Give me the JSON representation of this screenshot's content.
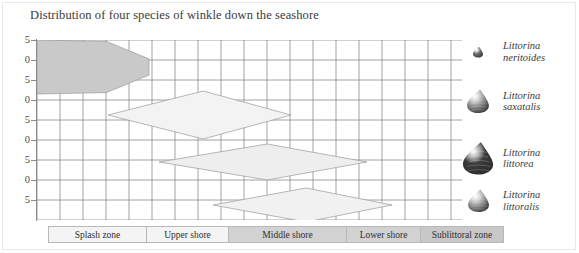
{
  "title": "Distribution of four species of winkle down the seashore",
  "chart_data": {
    "type": "area",
    "title": "Distribution of four species of winkle down the seashore",
    "xlabel": "",
    "ylabel": "",
    "grid": true,
    "legend_position": "right",
    "y_ticks": [
      "5",
      "0",
      "5",
      "0",
      "5",
      "0",
      "5",
      "0",
      "5"
    ],
    "zones": [
      {
        "label": "Splash zone",
        "width_px": 98,
        "fill": "#f4f4f4"
      },
      {
        "label": "Upper shore",
        "width_px": 82,
        "fill": "#f4f4f4"
      },
      {
        "label": "Middle shore",
        "width_px": 118,
        "fill": "#d2d2d2"
      },
      {
        "label": "Lower shore",
        "width_px": 74,
        "fill": "#d2d2d2"
      },
      {
        "label": "Sublittoral zone",
        "width_px": 82,
        "fill": "#c8c8c8"
      }
    ],
    "series": [
      {
        "name": "Littorina neritoides",
        "fill": "#c9c9c9",
        "start_x": 0,
        "end_x": 112,
        "center_y": 27,
        "peak_half_height": 27,
        "shape": "block-taper"
      },
      {
        "name": "Littorina saxatalis",
        "fill": "#f3f3f3",
        "start_x": 71,
        "end_x": 254,
        "center_y": 75,
        "peak_half_height": 24,
        "shape": "kite"
      },
      {
        "name": "Littorina littorea",
        "fill": "#eeeeee",
        "start_x": 122,
        "end_x": 330,
        "center_y": 122,
        "peak_half_height": 18,
        "shape": "kite"
      },
      {
        "name": "Littorina littoralis",
        "fill": "#f1f1f1",
        "start_x": 176,
        "end_x": 355,
        "center_y": 165,
        "peak_half_height": 17,
        "shape": "kite"
      }
    ]
  },
  "legend": {
    "items": [
      {
        "name_line1": "Littorina",
        "name_line2": "neritoides",
        "shell": "shell-small-dark",
        "size": 12,
        "tone": "#6a6a6a"
      },
      {
        "name_line1": "Littorina",
        "name_line2": "saxatalis",
        "shell": "shell-medium-grey",
        "size": 26,
        "tone": "#9d9d9d"
      },
      {
        "name_line1": "Littorina",
        "name_line2": "littorea",
        "shell": "shell-large-dark",
        "size": 36,
        "tone": "#3b3b3b"
      },
      {
        "name_line1": "Littorina",
        "name_line2": "littoralis",
        "shell": "shell-medium-light",
        "size": 25,
        "tone": "#a8a8a8"
      }
    ]
  },
  "colors": {
    "grid": "#8c8c8c",
    "axis": "#8a8a8a",
    "text": "#3a3a3a",
    "background": "#ffffff"
  }
}
